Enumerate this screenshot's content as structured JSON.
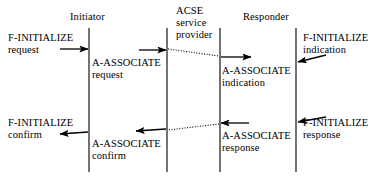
{
  "diagram": {
    "type": "sequence-diagram",
    "stroke_color": "#000000",
    "background_color": "#ffffff",
    "lifelines": [
      {
        "name": "initiator",
        "header": "Initiator",
        "x": 89,
        "y_top": 28,
        "y_bottom": 172
      },
      {
        "name": "acse-left",
        "header": "ACSE service provider",
        "x": 167,
        "y_top": 28,
        "y_bottom": 172
      },
      {
        "name": "acse-right",
        "header": "",
        "x": 220,
        "y_top": 28,
        "y_bottom": 172
      },
      {
        "name": "responder",
        "header": "Responder",
        "x": 296,
        "y_top": 28,
        "y_bottom": 172
      }
    ],
    "headers": {
      "initiator": "Initiator",
      "acse_line1": "ACSE",
      "acse_line2": "service",
      "acse_line3": "provider",
      "responder": "Responder"
    },
    "messages": [
      {
        "name": "f-initialize-request",
        "line1": "F-INITIALIZE",
        "line2": "request",
        "direction": "right",
        "style": "solid",
        "from_x": 60,
        "to_x": 89,
        "y": 49
      },
      {
        "name": "a-associate-request",
        "line1": "A-ASSOCIATE",
        "line2": "request",
        "direction": "right",
        "style": "solid",
        "from_x": 139,
        "to_x": 167,
        "y": 50
      },
      {
        "name": "acse-transfer-down",
        "line1": "",
        "line2": "",
        "direction": "right",
        "style": "dotted",
        "from_x": 167,
        "to_x": 220,
        "y": 50
      },
      {
        "name": "a-associate-indication",
        "line1": "A-ASSOCIATE",
        "line2": "indication",
        "direction": "right",
        "style": "solid",
        "from_x": 220,
        "to_x": 250,
        "y": 57
      },
      {
        "name": "f-initialize-indication",
        "line1": "F-INITIALIZE",
        "line2": "indication",
        "direction": "left",
        "style": "solid",
        "from_x": 326,
        "to_x": 296,
        "y": 60
      },
      {
        "name": "f-initialize-confirm",
        "line1": "F-INITIALIZE",
        "line2": "confirm",
        "direction": "left",
        "style": "solid",
        "from_x": 89,
        "to_x": 60,
        "y": 133
      },
      {
        "name": "a-associate-confirm",
        "line1": "A-ASSOCIATE",
        "line2": "confirm",
        "direction": "left",
        "style": "solid",
        "from_x": 167,
        "to_x": 136,
        "y": 130
      },
      {
        "name": "acse-transfer-up",
        "line1": "",
        "line2": "",
        "direction": "left",
        "style": "dotted",
        "from_x": 220,
        "to_x": 167,
        "y": 127
      },
      {
        "name": "a-associate-response",
        "line1": "A-ASSOCIATE",
        "line2": "response",
        "direction": "left",
        "style": "solid",
        "from_x": 248,
        "to_x": 220,
        "y": 124
      },
      {
        "name": "f-initialize-response",
        "line1": "F-INITIALIZE",
        "line2": "response",
        "direction": "left",
        "style": "solid",
        "from_x": 326,
        "to_x": 296,
        "y": 121
      }
    ]
  }
}
